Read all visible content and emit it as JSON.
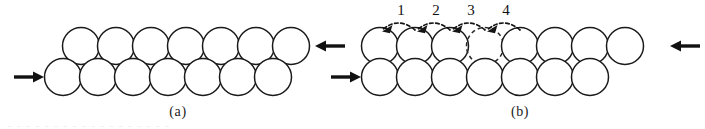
{
  "figure": {
    "width": 705,
    "height": 129,
    "background": "#ffffff",
    "ink_color": "#1a1a1a",
    "scan_artifact_text": "_ _ _ _ _ _ _ _ _ _ _ _ _ _ _ _ _ _"
  },
  "panels": [
    {
      "id": "a",
      "caption": "(a)",
      "caption_x": 178,
      "caption_y": 116,
      "description": "perfect close-packed two-row lattice under opposed compressive load",
      "circle_radius": 18.5,
      "rows": [
        {
          "name": "top-row",
          "y": 46,
          "x_start": 81,
          "count": 7,
          "spacing": 35,
          "style": "solid"
        },
        {
          "name": "bottom-row",
          "y": 77,
          "x_start": 63,
          "count": 7,
          "spacing": 35,
          "style": "solid"
        }
      ],
      "load_arrows": [
        {
          "name": "left-load-arrow",
          "direction": "right",
          "tail_x": 14,
          "tip_x": 44,
          "y": 77
        },
        {
          "name": "right-load-arrow",
          "direction": "left",
          "tail_x": 345,
          "tip_x": 315,
          "y": 46
        }
      ]
    },
    {
      "id": "b",
      "caption": "(b)",
      "caption_x": 520,
      "caption_y": 116,
      "description": "same lattice containing a vacancy with four sequential atomic hops",
      "circle_radius": 18.5,
      "rows": [
        {
          "name": "top-row",
          "y": 46,
          "x_start": 380,
          "count": 8,
          "spacing": 35,
          "style": "mixed",
          "vacancy_index": 3
        },
        {
          "name": "bottom-row",
          "y": 77,
          "x_start": 380,
          "count": 7,
          "spacing": 35,
          "style": "solid"
        }
      ],
      "load_arrows": [
        {
          "name": "left-load-arrow",
          "direction": "right",
          "tail_x": 331,
          "tip_x": 361,
          "y": 77
        },
        {
          "name": "right-load-arrow",
          "direction": "left",
          "tail_x": 700,
          "tip_x": 670,
          "y": 46
        }
      ],
      "hops": [
        {
          "label": "1",
          "label_x": 401,
          "label_y": 15,
          "from_x": 415,
          "to_x": 382,
          "arc_y": 27
        },
        {
          "label": "2",
          "label_x": 436,
          "label_y": 15,
          "from_x": 450,
          "to_x": 417,
          "arc_y": 27
        },
        {
          "label": "3",
          "label_x": 471,
          "label_y": 15,
          "from_x": 485,
          "to_x": 452,
          "arc_y": 27
        },
        {
          "label": "4",
          "label_x": 506,
          "label_y": 15,
          "from_x": 520,
          "to_x": 487,
          "arc_y": 27
        }
      ]
    }
  ]
}
